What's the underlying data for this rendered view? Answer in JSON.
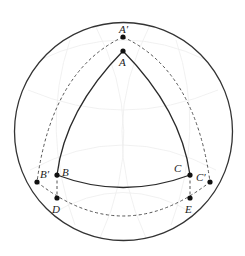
{
  "diagram": {
    "type": "spherical-triangle-construction",
    "colors": {
      "outline": "#333333",
      "solid": "#2a2a2a",
      "dashed": "#555555",
      "point": "#111111",
      "faint": "#ececec"
    },
    "circle": {
      "cx": 123.5,
      "cy": 131.5,
      "r": 109
    },
    "points": {
      "A": {
        "label": "A",
        "x": 123,
        "y": 51
      },
      "A2": {
        "label": "A′",
        "x": 123,
        "y": 37
      },
      "B": {
        "label": "B",
        "x": 57,
        "y": 175
      },
      "B2": {
        "label": "B′",
        "x": 37,
        "y": 182
      },
      "C": {
        "label": "C",
        "x": 190,
        "y": 175
      },
      "C2": {
        "label": "C′",
        "x": 210,
        "y": 182
      },
      "D": {
        "label": "D",
        "x": 57,
        "y": 198
      },
      "E": {
        "label": "E",
        "x": 190,
        "y": 198
      }
    },
    "labels": {
      "A": "A",
      "A_prime": "A′",
      "B": "B",
      "B_prime": "B′",
      "C": "C",
      "C_prime": "C′",
      "D": "D",
      "E": "E"
    }
  }
}
